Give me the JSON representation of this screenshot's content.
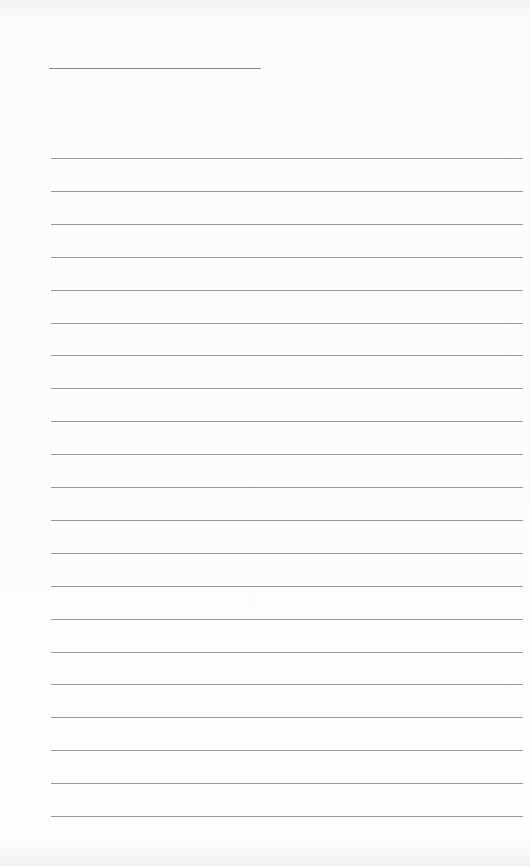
{
  "document": {
    "type": "blank lined writing sheet",
    "header_line": {
      "text": ""
    },
    "ruled_lines": [
      {
        "text": ""
      },
      {
        "text": ""
      },
      {
        "text": ""
      },
      {
        "text": ""
      },
      {
        "text": ""
      },
      {
        "text": ""
      },
      {
        "text": ""
      },
      {
        "text": ""
      },
      {
        "text": ""
      },
      {
        "text": ""
      },
      {
        "text": ""
      },
      {
        "text": ""
      },
      {
        "text": ""
      },
      {
        "text": ""
      },
      {
        "text": ""
      },
      {
        "text": ""
      },
      {
        "text": ""
      },
      {
        "text": ""
      },
      {
        "text": ""
      },
      {
        "text": ""
      },
      {
        "text": ""
      }
    ],
    "line_color": "#9a9a9a",
    "paper_color": "#fcfcfc"
  }
}
